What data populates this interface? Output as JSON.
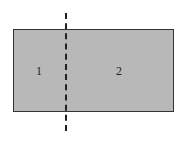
{
  "diagram": {
    "regions": [
      {
        "label": "1"
      },
      {
        "label": "2"
      }
    ],
    "colors": {
      "fill": "#b8b8b8",
      "border": "#333333",
      "dash": "#222222"
    }
  }
}
